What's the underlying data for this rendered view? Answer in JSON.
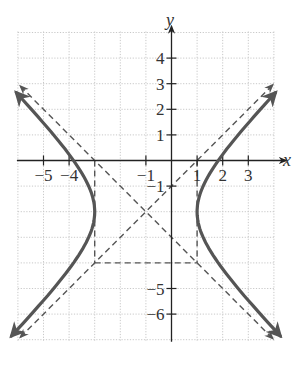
{
  "chart_data": {
    "type": "line",
    "title": "",
    "xlabel": "x",
    "ylabel": "y",
    "xlim": [
      -6,
      4
    ],
    "ylim": [
      -7,
      5
    ],
    "grid": true,
    "x_tick_labels": [
      "-5",
      "-4",
      "-1",
      "1",
      "2",
      "3"
    ],
    "x_ticks": [
      -5,
      -4,
      -1,
      1,
      2,
      3
    ],
    "y_tick_labels": [
      "4",
      "3",
      "2",
      "1",
      "-1",
      "-5",
      "-6"
    ],
    "y_ticks": [
      4,
      3,
      2,
      1,
      -1,
      -5,
      -6
    ],
    "series": [
      {
        "name": "hyperbola",
        "equation": "(x+1)^2/4 - (y+2)^2/4 = 1",
        "center": [
          -1,
          -2
        ],
        "vertices": [
          [
            -3,
            -2
          ],
          [
            1,
            -2
          ]
        ],
        "style": "solid-thick",
        "color": "#555555"
      },
      {
        "name": "asymptote-1",
        "equation": "y + 2 = (x + 1)",
        "style": "dashed",
        "color": "#555555"
      },
      {
        "name": "asymptote-2",
        "equation": "y + 2 = -(x + 1)",
        "style": "dashed",
        "color": "#555555"
      },
      {
        "name": "fundamental-rectangle",
        "corners": [
          [
            -3,
            0
          ],
          [
            1,
            0
          ],
          [
            1,
            -4
          ],
          [
            -3,
            -4
          ]
        ],
        "style": "dashed",
        "color": "#555555"
      }
    ]
  },
  "labels": {
    "x_axis": "x",
    "y_axis": "y"
  }
}
